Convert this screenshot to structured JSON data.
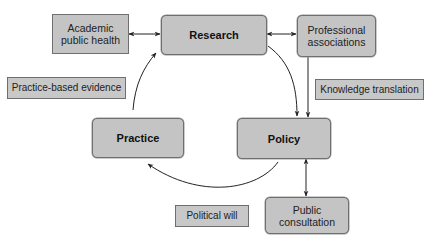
{
  "diagram": {
    "type": "cycle-flow",
    "colors": {
      "node_fill": "#c4c4c4",
      "node_border": "#6f6f6f",
      "arrow": "#222222",
      "background": "#ffffff"
    },
    "nodes": {
      "academic_public_health": {
        "line1": "Academic",
        "line2": "public health"
      },
      "research": {
        "label": "Research"
      },
      "professional_associations": {
        "line1": "Professional",
        "line2": "associations"
      },
      "practice": {
        "label": "Practice"
      },
      "policy": {
        "label": "Policy"
      },
      "public_consultation": {
        "line1": "Public",
        "line2": "consultation"
      }
    },
    "edge_labels": {
      "practice_based_evidence": "Practice-based evidence",
      "knowledge_translation": "Knowledge translation",
      "political_will": "Political will"
    },
    "edges": [
      {
        "from": "Academic public health",
        "to": "Research",
        "direction": "both"
      },
      {
        "from": "Research",
        "to": "Professional associations",
        "direction": "both"
      },
      {
        "from": "Research",
        "to": "Policy",
        "direction": "forward",
        "style": "curved"
      },
      {
        "from": "Professional associations",
        "to": "Policy",
        "direction": "forward",
        "label": "Knowledge translation"
      },
      {
        "from": "Policy",
        "to": "Practice",
        "direction": "forward",
        "style": "curved",
        "label": "Political will"
      },
      {
        "from": "Practice",
        "to": "Research",
        "direction": "forward",
        "style": "curved",
        "label": "Practice-based evidence"
      },
      {
        "from": "Policy",
        "to": "Public consultation",
        "direction": "both"
      }
    ]
  }
}
